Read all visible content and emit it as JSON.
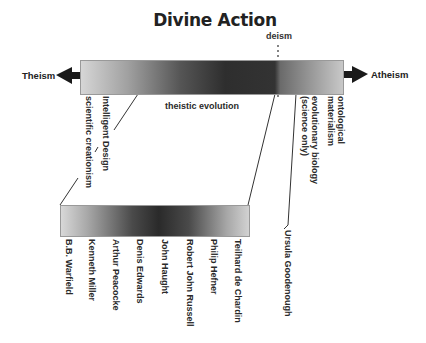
{
  "title": "Divine Action",
  "spectrum": {
    "left_end": "Theism",
    "right_end": "Atheism",
    "marker": "deism"
  },
  "top_bar_labels": {
    "below_left": [
      "scientific creationism",
      "Intelligent Design"
    ],
    "center": "theistic evolution",
    "below_right": [
      "evolutionary biology\n(science only)",
      "ontological\nmaterialism"
    ]
  },
  "bottom_bar_names": [
    "B.B. Warfield",
    "Kenneth Miller",
    "Arthur Peacocke",
    "Denis Edwards",
    "John Haught",
    "Robert John Russell",
    "Philip Hefner",
    "Teilhard de Chardin",
    "Ursula Goodenough"
  ],
  "colors": {
    "gradient_light": "#d6d6d6",
    "gradient_dark": "#2e2e2e",
    "text": "#222222",
    "arrow": "#1a1a1a"
  }
}
